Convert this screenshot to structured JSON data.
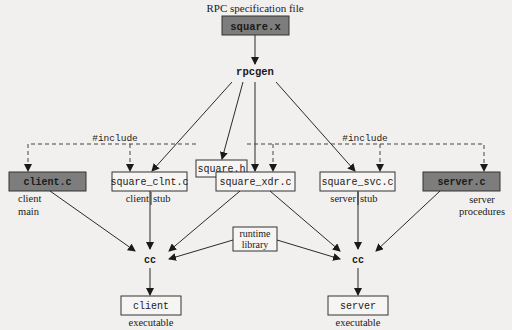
{
  "diagram": {
    "spec_label": "RPC specification file",
    "spec_file": "square.x",
    "generator": "rpcgen",
    "header_file": "square.h",
    "include_label_left": "#include",
    "include_label_right": "#include",
    "files": [
      {
        "name": "client.c",
        "style": "dark",
        "caption1": "client",
        "caption2": "main"
      },
      {
        "name": "square_clnt.c",
        "style": "light",
        "caption1": "client",
        "caption2": "stub"
      },
      {
        "name": "square_xdr.c",
        "style": "light",
        "caption1": "",
        "caption2": ""
      },
      {
        "name": "square_svc.c",
        "style": "light",
        "caption1": "server",
        "caption2": "stub"
      },
      {
        "name": "server.c",
        "style": "dark",
        "caption1": "server",
        "caption2": "procedures"
      }
    ],
    "runtime": {
      "line1": "runtime",
      "line2": "library"
    },
    "compiler_left": "cc",
    "compiler_right": "cc",
    "outputs": [
      {
        "name": "client",
        "caption": "executable"
      },
      {
        "name": "server",
        "caption": "executable"
      }
    ],
    "colors": {
      "dark_box": "#7d7d7d",
      "background": "#f1f0ee",
      "line": "#2a2a2a"
    }
  }
}
